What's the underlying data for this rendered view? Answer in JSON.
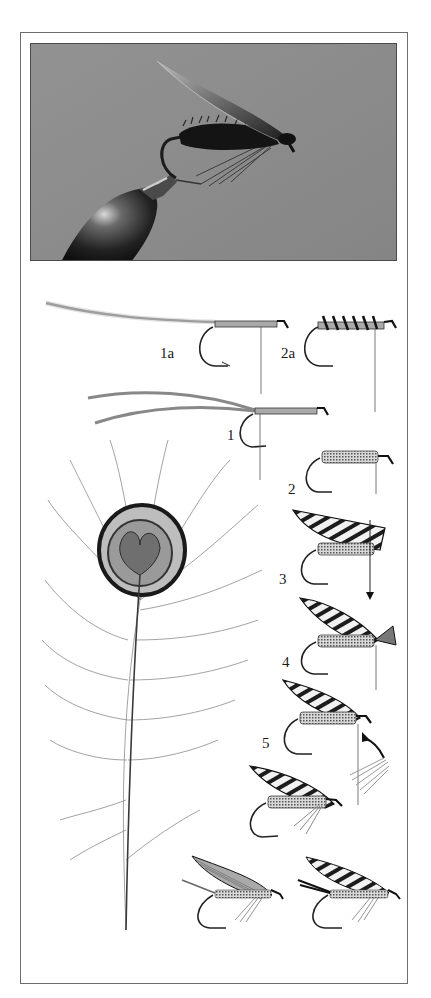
{
  "plate": {
    "photo": {
      "subject": "finished wet fly held in vise jaws",
      "background_color": "#8c8c8c"
    },
    "feather": {
      "subject": "peacock eye feather"
    },
    "steps": [
      {
        "id": "1a",
        "label": "1a"
      },
      {
        "id": "2a",
        "label": "2a"
      },
      {
        "id": "1",
        "label": "1"
      },
      {
        "id": "2",
        "label": "2"
      },
      {
        "id": "3",
        "label": "3"
      },
      {
        "id": "4",
        "label": "4"
      },
      {
        "id": "5",
        "label": "5"
      }
    ],
    "finished_flies": [
      {
        "id": "finished-left",
        "style": "plain wing"
      },
      {
        "id": "finished-right",
        "style": "barred wing"
      }
    ],
    "colors": {
      "frame": "#6e6e6e",
      "ink": "#1a1a1a",
      "photo_bg": "#8c8c8c"
    }
  }
}
